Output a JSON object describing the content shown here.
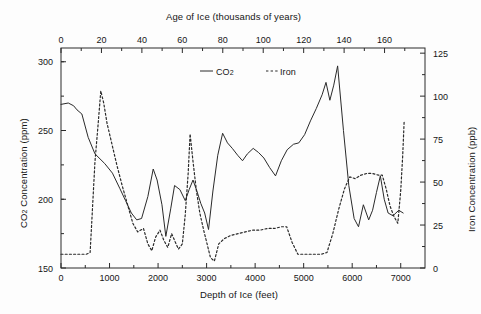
{
  "figure": {
    "background": "#fdfdfd",
    "line_color": "#2a2a2a"
  },
  "legend": {
    "position": "top-center-inside",
    "entries": [
      {
        "label": "CO2",
        "label_main": "CO",
        "label_sub": "2",
        "style": "solid",
        "name": "legend-co2"
      },
      {
        "label": "Iron",
        "label_main": "Iron",
        "label_sub": "",
        "style": "dashed",
        "name": "legend-iron"
      }
    ]
  },
  "axes": {
    "top": {
      "title": "Age of Ice (thousands of years)",
      "ticks": [
        "0",
        "20",
        "40",
        "60",
        "80",
        "100",
        "120",
        "140",
        "160"
      ],
      "min": 0,
      "max": 180
    },
    "bottom": {
      "title": "Depth of Ice (feet)",
      "ticks": [
        "0",
        "1000",
        "2000",
        "3000",
        "4000",
        "5000",
        "6000",
        "7000"
      ],
      "min": 0,
      "max": 7500
    },
    "left": {
      "title_main": "CO",
      "title_sub": "2",
      "title_rest": " Concentration (ppm)",
      "title": "CO2 Concentration (ppm)",
      "ticks": [
        "150",
        "200",
        "250",
        "300"
      ],
      "min": 150,
      "max": 310
    },
    "right": {
      "title": "Iron Concentration (ppb)",
      "ticks": [
        "0",
        "25",
        "50",
        "75",
        "100",
        "125"
      ],
      "min": 0,
      "max": 128
    }
  },
  "chart_data": {
    "type": "line",
    "title": "",
    "xlabel": "Depth of Ice (feet)",
    "ylabel": "CO2 Concentration (ppm)",
    "y2label": "Iron Concentration (ppb)",
    "xlim": [
      0,
      7500
    ],
    "ylim": [
      150,
      310
    ],
    "y2lim": [
      0,
      128
    ],
    "top_axis_label": "Age of Ice (thousands of years)",
    "top_axis_lim": [
      0,
      180
    ],
    "grid": false,
    "legend_entries": [
      "CO2",
      "Iron"
    ],
    "series": [
      {
        "name": "CO2",
        "axis": "left",
        "style": "solid",
        "units": "ppm",
        "points": [
          [
            0,
            269
          ],
          [
            150,
            270
          ],
          [
            260,
            268
          ],
          [
            330,
            265
          ],
          [
            430,
            262
          ],
          [
            560,
            245
          ],
          [
            700,
            233
          ],
          [
            900,
            226
          ],
          [
            1060,
            219
          ],
          [
            1210,
            208
          ],
          [
            1330,
            199
          ],
          [
            1450,
            190
          ],
          [
            1560,
            185
          ],
          [
            1660,
            186
          ],
          [
            1790,
            202
          ],
          [
            1900,
            222
          ],
          [
            1980,
            214
          ],
          [
            2080,
            196
          ],
          [
            2160,
            173
          ],
          [
            2260,
            193
          ],
          [
            2340,
            210
          ],
          [
            2450,
            207
          ],
          [
            2560,
            199
          ],
          [
            2640,
            207
          ],
          [
            2720,
            214
          ],
          [
            2800,
            206
          ],
          [
            2880,
            197
          ],
          [
            2960,
            190
          ],
          [
            3040,
            178
          ],
          [
            3130,
            206
          ],
          [
            3230,
            232
          ],
          [
            3330,
            248
          ],
          [
            3430,
            241
          ],
          [
            3530,
            237
          ],
          [
            3640,
            232
          ],
          [
            3740,
            228
          ],
          [
            3840,
            233
          ],
          [
            3960,
            237
          ],
          [
            4070,
            234
          ],
          [
            4180,
            230
          ],
          [
            4300,
            223
          ],
          [
            4420,
            217
          ],
          [
            4540,
            228
          ],
          [
            4660,
            236
          ],
          [
            4790,
            240
          ],
          [
            4900,
            241
          ],
          [
            5020,
            247
          ],
          [
            5140,
            257
          ],
          [
            5260,
            266
          ],
          [
            5380,
            276
          ],
          [
            5460,
            285
          ],
          [
            5540,
            272
          ],
          [
            5620,
            283
          ],
          [
            5700,
            297
          ],
          [
            5820,
            250
          ],
          [
            5930,
            210
          ],
          [
            6040,
            186
          ],
          [
            6130,
            180
          ],
          [
            6230,
            196
          ],
          [
            6340,
            185
          ],
          [
            6420,
            192
          ],
          [
            6500,
            205
          ],
          [
            6580,
            217
          ],
          [
            6660,
            200
          ],
          [
            6740,
            190
          ],
          [
            6840,
            188
          ],
          [
            6960,
            192
          ],
          [
            7050,
            190
          ]
        ]
      },
      {
        "name": "Iron",
        "axis": "right",
        "style": "dashed",
        "units": "ppb",
        "points": [
          [
            0,
            8
          ],
          [
            160,
            8
          ],
          [
            300,
            8
          ],
          [
            420,
            8
          ],
          [
            520,
            8
          ],
          [
            600,
            9
          ],
          [
            640,
            30
          ],
          [
            700,
            62
          ],
          [
            760,
            82
          ],
          [
            820,
            103
          ],
          [
            880,
            96
          ],
          [
            950,
            84
          ],
          [
            1050,
            72
          ],
          [
            1150,
            60
          ],
          [
            1260,
            48
          ],
          [
            1380,
            36
          ],
          [
            1480,
            26
          ],
          [
            1580,
            21
          ],
          [
            1700,
            23
          ],
          [
            1790,
            14
          ],
          [
            1870,
            10
          ],
          [
            1950,
            18
          ],
          [
            2040,
            22
          ],
          [
            2120,
            16
          ],
          [
            2200,
            12
          ],
          [
            2280,
            20
          ],
          [
            2340,
            16
          ],
          [
            2420,
            11
          ],
          [
            2500,
            14
          ],
          [
            2560,
            31
          ],
          [
            2620,
            55
          ],
          [
            2660,
            78
          ],
          [
            2720,
            62
          ],
          [
            2790,
            45
          ],
          [
            2860,
            32
          ],
          [
            2940,
            22
          ],
          [
            3010,
            14
          ],
          [
            3080,
            6
          ],
          [
            3160,
            4
          ],
          [
            3250,
            14
          ],
          [
            3360,
            17
          ],
          [
            3500,
            19
          ],
          [
            3650,
            20
          ],
          [
            3800,
            21
          ],
          [
            3950,
            22
          ],
          [
            4100,
            22
          ],
          [
            4250,
            23
          ],
          [
            4400,
            23
          ],
          [
            4540,
            24
          ],
          [
            4650,
            24
          ],
          [
            4760,
            15
          ],
          [
            4880,
            8
          ],
          [
            5000,
            8
          ],
          [
            5120,
            8
          ],
          [
            5240,
            8
          ],
          [
            5360,
            8
          ],
          [
            5480,
            9
          ],
          [
            5600,
            20
          ],
          [
            5720,
            34
          ],
          [
            5840,
            46
          ],
          [
            5950,
            53
          ],
          [
            6060,
            52
          ],
          [
            6180,
            54
          ],
          [
            6300,
            55
          ],
          [
            6420,
            55
          ],
          [
            6540,
            54
          ],
          [
            6620,
            54
          ],
          [
            6700,
            46
          ],
          [
            6780,
            36
          ],
          [
            6860,
            30
          ],
          [
            6940,
            26
          ],
          [
            7000,
            45
          ],
          [
            7040,
            65
          ],
          [
            7070,
            85
          ]
        ]
      }
    ]
  }
}
